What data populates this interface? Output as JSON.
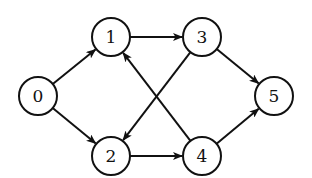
{
  "diagram": {
    "type": "directed-graph",
    "colors": {
      "stroke": "#111111",
      "fill": "#ffffff",
      "text": "#111111"
    },
    "node_radius": 19,
    "nodes": [
      {
        "id": "0",
        "label": "0",
        "x": 38,
        "y": 96
      },
      {
        "id": "1",
        "label": "1",
        "x": 111,
        "y": 37
      },
      {
        "id": "2",
        "label": "2",
        "x": 111,
        "y": 156
      },
      {
        "id": "3",
        "label": "3",
        "x": 202,
        "y": 37
      },
      {
        "id": "4",
        "label": "4",
        "x": 202,
        "y": 156
      },
      {
        "id": "5",
        "label": "5",
        "x": 274,
        "y": 96
      }
    ],
    "edges": [
      {
        "from": "0",
        "to": "1"
      },
      {
        "from": "0",
        "to": "2"
      },
      {
        "from": "1",
        "to": "3"
      },
      {
        "from": "3",
        "to": "2"
      },
      {
        "from": "4",
        "to": "1"
      },
      {
        "from": "2",
        "to": "4"
      },
      {
        "from": "3",
        "to": "5"
      },
      {
        "from": "4",
        "to": "5"
      }
    ]
  }
}
